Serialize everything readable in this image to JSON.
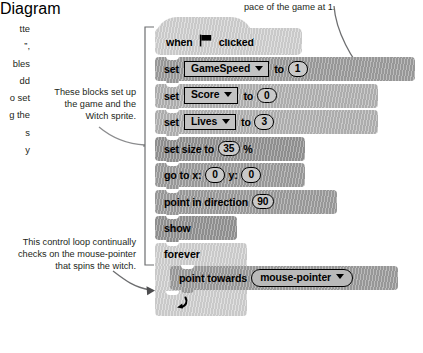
{
  "annotations": {
    "cut_off_left": "tte\n”,\nbles\ndd\no set\ng the\ns\ny",
    "top_right": "pace of the game at 1.",
    "blocks_label": "These blocks set up the game and the Witch sprite.",
    "loop_label": "This control loop continually checks on the mouse-pointer that spins the witch."
  },
  "script": {
    "hat": {
      "word_when": "when",
      "icon": "green-flag-icon",
      "word_clicked": "clicked"
    },
    "blocks": [
      {
        "id": "set-gamespeed",
        "kind": "set-variable",
        "label_set": "set",
        "variable": "GameSpeed",
        "label_to": "to",
        "value": "1",
        "width": 260,
        "shade": "g-dark"
      },
      {
        "id": "set-score",
        "kind": "set-variable",
        "label_set": "set",
        "variable": "Score",
        "label_to": "to",
        "value": "0",
        "width": 223,
        "shade": "g-mid"
      },
      {
        "id": "set-lives",
        "kind": "set-variable",
        "label_set": "set",
        "variable": "Lives",
        "label_to": "to",
        "value": "3",
        "width": 223,
        "shade": "g-mid"
      },
      {
        "id": "set-size-to",
        "kind": "set-size",
        "label_prefix": "set size to",
        "value": "35",
        "label_suffix": "%",
        "width": 150,
        "shade": "g-darker"
      },
      {
        "id": "go-to-xy",
        "kind": "go-to-xy",
        "label_x": "go to x:",
        "x_value": "0",
        "label_y": "y:",
        "y_value": "0",
        "width": 150,
        "shade": "g-dark"
      },
      {
        "id": "point-in-direction",
        "kind": "point-in-direction",
        "label_prefix": "point in direction",
        "value": "90",
        "width": 182,
        "shade": "g-dark"
      },
      {
        "id": "show",
        "kind": "simple",
        "label": "show",
        "width": 82,
        "shade": "g-darker"
      }
    ],
    "forever": {
      "label": "forever",
      "top_width": 92,
      "loop_arrow": "↺",
      "inner": {
        "id": "point-towards",
        "label_prefix": "point towards",
        "target": "mouse-pointer",
        "width": 228
      }
    }
  }
}
